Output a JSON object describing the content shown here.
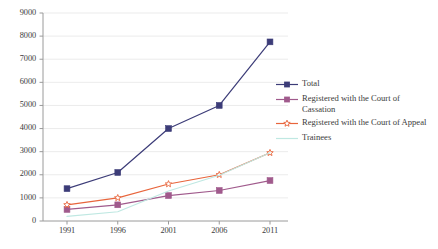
{
  "chart_data": {
    "type": "line",
    "title": "",
    "subtitle": "",
    "xlabel": "",
    "ylabel": "",
    "x": [
      "1991",
      "1996",
      "2001",
      "2006",
      "2011"
    ],
    "categories": [
      "1991",
      "1996",
      "2001",
      "2006",
      "2011"
    ],
    "xlim": [
      1991,
      2011
    ],
    "ylim": [
      0,
      9000
    ],
    "y_ticks": [
      0,
      1000,
      2000,
      3000,
      4000,
      5000,
      6000,
      7000,
      8000,
      9000
    ],
    "y_tick_labels": [
      "0",
      "1000",
      "2000",
      "3000",
      "4000",
      "5000",
      "6000",
      "7000",
      "8000",
      "9000"
    ],
    "x_tick_labels": [
      "1991",
      "1996",
      "2001",
      "2006",
      "2011"
    ],
    "grid": "horizontal",
    "legend_position": "right",
    "series": [
      {
        "name": "Total",
        "color": "#3c3c78",
        "marker": "filled-square",
        "values": [
          1400,
          2100,
          4000,
          5000,
          7750
        ]
      },
      {
        "name": "Registered with the Court of Cassation",
        "color": "#a05a8c",
        "marker": "filled-square",
        "values": [
          500,
          700,
          1100,
          1320,
          1750
        ]
      },
      {
        "name": "Registered with the Court of Appeal",
        "color": "#e8653c",
        "marker": "open-star",
        "values": [
          700,
          1000,
          1600,
          2000,
          2950
        ]
      },
      {
        "name": "Trainees",
        "color": "#bfe8e2",
        "marker": "none",
        "values": [
          200,
          400,
          1300,
          1980,
          2950
        ]
      }
    ]
  },
  "legend": {
    "items": [
      {
        "label": "Total"
      },
      {
        "label": "Registered with the Court of Cassation"
      },
      {
        "label": "Registered with the Court of Appeal"
      },
      {
        "label": "Trainees"
      }
    ]
  },
  "colors": {
    "background": "#ffffff",
    "axis": "#9a9a9a",
    "gridline": "#e6e6e6",
    "text": "#3b3b3b",
    "series_total": "#3c3c78",
    "series_cassation": "#a05a8c",
    "series_appeal": "#e8653c",
    "series_trainees": "#bfe8e2"
  }
}
